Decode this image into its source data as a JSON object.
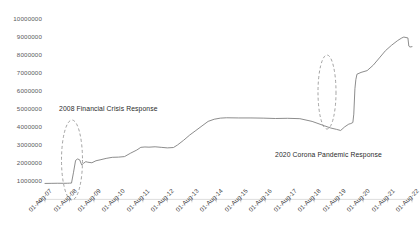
{
  "chart_data": {
    "type": "line",
    "title": "",
    "subtitle": "",
    "xlabel": "",
    "ylabel": "",
    "grid": false,
    "legend": null,
    "ylim": [
      0,
      10000000
    ],
    "ytick_labels": [
      "10000000",
      "9000000",
      "8000000",
      "7000000",
      "6000000",
      "5000000",
      "4000000",
      "3000000",
      "2000000",
      "1000000",
      "0"
    ],
    "ytick_values": [
      10000000,
      9000000,
      8000000,
      7000000,
      6000000,
      5000000,
      4000000,
      3000000,
      2000000,
      1000000,
      0
    ],
    "xtick_labels": [
      "01-Aug-07",
      "01-Aug-08",
      "01-Aug-09",
      "01-Aug-10",
      "01-Aug-11",
      "01-Aug-12",
      "01-Aug-13",
      "01-Aug-14",
      "01-Aug-15",
      "01-Aug-16",
      "01-Aug-17",
      "01-Aug-18",
      "01-Aug-19",
      "01-Aug-20",
      "01-Aug-21",
      "01-Aug-22"
    ],
    "xlim": [
      "01-Aug-07",
      "01-Aug-22"
    ],
    "line_color": "#7f7f7f",
    "series": [
      {
        "name": "Federal Reserve Balance Sheet",
        "x": [
          "01-Aug-07",
          "01-Nov-07",
          "01-Feb-08",
          "01-May-08",
          "01-Jul-08",
          "01-Aug-08",
          "01-Sep-08",
          "01-Oct-08",
          "01-Nov-08",
          "01-Dec-08",
          "01-Jan-09",
          "01-Feb-09",
          "01-Mar-09",
          "01-Apr-09",
          "01-May-09",
          "01-Jul-09",
          "01-Sep-09",
          "01-Nov-09",
          "01-Feb-10",
          "01-May-10",
          "01-Aug-10",
          "01-Nov-10",
          "01-Feb-11",
          "01-May-11",
          "01-Jul-11",
          "01-Sep-11",
          "01-Nov-11",
          "01-Feb-12",
          "01-May-12",
          "01-Aug-12",
          "01-Nov-12",
          "01-Jan-13",
          "01-Apr-13",
          "01-Jul-13",
          "01-Oct-13",
          "01-Jan-14",
          "01-Apr-14",
          "01-Jul-14",
          "01-Oct-14",
          "01-Jan-15",
          "01-Jul-15",
          "01-Jan-16",
          "01-Jul-16",
          "01-Jan-17",
          "01-Jul-17",
          "01-Jan-18",
          "01-Jul-18",
          "01-Jan-19",
          "01-Apr-19",
          "01-Jul-19",
          "01-Sep-19",
          "01-Nov-19",
          "01-Jan-20",
          "01-Feb-20",
          "01-Mar-20",
          "15-Mar-20",
          "01-Apr-20",
          "15-Apr-20",
          "01-May-20",
          "01-Jul-20",
          "01-Oct-20",
          "01-Jan-21",
          "01-Apr-21",
          "01-Jul-21",
          "01-Oct-21",
          "01-Jan-22",
          "01-Mar-22",
          "01-Apr-22",
          "01-Jun-22",
          "15-Jun-22",
          "01-Jul-22",
          "01-Aug-22"
        ],
        "values": [
          880000,
          885000,
          890000,
          888000,
          890000,
          895000,
          900000,
          1500000,
          2150000,
          2230000,
          2180000,
          1900000,
          2000000,
          2080000,
          2050000,
          2020000,
          2130000,
          2180000,
          2260000,
          2320000,
          2330000,
          2360000,
          2550000,
          2720000,
          2870000,
          2890000,
          2880000,
          2900000,
          2870000,
          2840000,
          2860000,
          3000000,
          3260000,
          3550000,
          3800000,
          4050000,
          4300000,
          4420000,
          4480000,
          4500000,
          4490000,
          4490000,
          4480000,
          4460000,
          4470000,
          4450000,
          4300000,
          4060000,
          3940000,
          3860000,
          3800000,
          4000000,
          4150000,
          4180000,
          4240000,
          4700000,
          6100000,
          6600000,
          6900000,
          7000000,
          7100000,
          7400000,
          7800000,
          8200000,
          8500000,
          8760000,
          8900000,
          8950000,
          8900000,
          8450000,
          8400000,
          8420000
        ]
      }
    ],
    "annotations": [
      {
        "id": "annotation-2008",
        "text": "2008 Financial Crisis Response",
        "marker": "dashed-ellipse",
        "target_x": "01-Aug-08"
      },
      {
        "id": "annotation-2020",
        "text": "2020 Corona Pandemic Response",
        "marker": "dashed-ellipse",
        "target_x": "01-Mar-20"
      }
    ]
  }
}
